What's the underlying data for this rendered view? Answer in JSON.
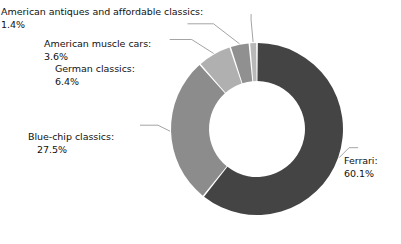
{
  "chart_data": {
    "type": "pie",
    "variant": "donut",
    "title": "",
    "subtitle": "",
    "xlabel": "",
    "ylabel": "",
    "legend_position": "none",
    "grid": false,
    "labels_outside": true,
    "leader_lines": true,
    "start_angle_deg": 0,
    "direction": "clockwise",
    "center": {
      "x": 257,
      "y": 129
    },
    "outer_radius": 86,
    "inner_radius": 48,
    "slice_gap_deg": 1.1,
    "categories": [
      "Ferrari",
      "Blue-chip classics",
      "German classics",
      "American muscle cars",
      "American antiques and affordable classics"
    ],
    "values": [
      60.1,
      27.5,
      6.4,
      3.6,
      1.4
    ],
    "value_unit": "%",
    "colors": [
      "#444444",
      "#8c8c8c",
      "#b0b0b0",
      "#909090",
      "#b8b8b8"
    ],
    "slices": [
      {
        "name": "Ferrari",
        "label": "Ferrari:",
        "percent": "60.1%",
        "value": 60.1,
        "color": "#444444",
        "label_side": "right"
      },
      {
        "name": "Blue-chip classics",
        "label": "Blue-chip classics:",
        "percent": "27.5%",
        "value": 27.5,
        "color": "#8c8c8c",
        "label_side": "left"
      },
      {
        "name": "German classics",
        "label": "German classics:",
        "percent": "6.4%",
        "value": 6.4,
        "color": "#b0b0b0",
        "label_side": "left"
      },
      {
        "name": "American muscle cars",
        "label": "American muscle cars:",
        "percent": "3.6%",
        "value": 3.6,
        "color": "#909090",
        "label_side": "left"
      },
      {
        "name": "American antiques and affordable classics",
        "label": "American antiques and affordable classics:",
        "percent": "1.4%",
        "value": 1.4,
        "color": "#b8b8b8",
        "label_side": "left"
      }
    ],
    "background_color": "#ffffff",
    "text_color": "#111111",
    "leader_line_color": "#9a9a9a"
  }
}
